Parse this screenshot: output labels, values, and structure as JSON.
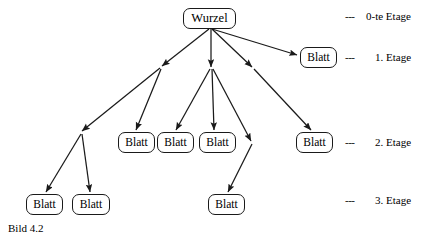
{
  "figure": {
    "caption": "Bild 4.2",
    "root_label": "Wurzel",
    "leaf_label": "Blatt"
  },
  "nodes": {
    "root": {
      "label": "Wurzel",
      "x": 183,
      "y": 8,
      "w": 53,
      "h": 21
    },
    "level1": [
      {
        "label": "Blatt",
        "x": 300,
        "y": 47,
        "w": 37,
        "h": 21
      }
    ],
    "level2": [
      {
        "label": "Blatt",
        "x": 118,
        "y": 132,
        "w": 37,
        "h": 21
      },
      {
        "label": "Blatt",
        "x": 157,
        "y": 132,
        "w": 37,
        "h": 21
      },
      {
        "label": "Blatt",
        "x": 199,
        "y": 132,
        "w": 37,
        "h": 21
      },
      {
        "label": "Blatt",
        "x": 296,
        "y": 132,
        "w": 37,
        "h": 21
      }
    ],
    "level3": [
      {
        "label": "Blatt",
        "x": 26,
        "y": 194,
        "w": 37,
        "h": 21
      },
      {
        "label": "Blatt",
        "x": 72,
        "y": 194,
        "w": 38,
        "h": 21
      },
      {
        "label": "Blatt",
        "x": 208,
        "y": 194,
        "w": 37,
        "h": 21
      }
    ]
  },
  "levels": [
    {
      "dash": "---",
      "label": "0-te Etage",
      "y": 10,
      "dash_x": 345,
      "label_x": 366
    },
    {
      "dash": "---",
      "label": "1. Etage",
      "y": 51,
      "dash_x": 345,
      "label_x": 375
    },
    {
      "dash": "---",
      "label": "2. Etage",
      "y": 136,
      "dash_x": 345,
      "label_x": 375
    },
    {
      "dash": "---",
      "label": "3. Etage",
      "y": 194,
      "dash_x": 345,
      "label_x": 375
    }
  ],
  "edges": {
    "stroke": "#1a1a1a",
    "description": "directed tree edges with arrowheads"
  }
}
